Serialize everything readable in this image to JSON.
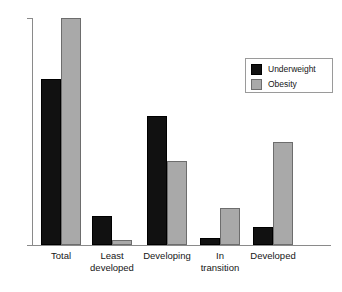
{
  "chart_data": {
    "type": "bar",
    "title": "",
    "subtitle": "",
    "xlabel": "",
    "ylabel": "",
    "categories": [
      "Total",
      "Least\ndeveloped",
      "Developing",
      "In\ntransition",
      "Developed"
    ],
    "series": [
      {
        "name": "Underweight",
        "color": "#111111",
        "values": [
          16.4,
          2.9,
          12.7,
          0.7,
          1.8
        ]
      },
      {
        "name": "Obesity",
        "color": "#a9a9a9",
        "values": [
          22.4,
          0.5,
          8.3,
          3.7,
          10.2
        ]
      }
    ],
    "ylim": [
      0,
      22.4
    ],
    "grid": false,
    "axis_ticks_visible": false,
    "legend_position": "top-right"
  },
  "legend": {
    "items": [
      {
        "label": "Underweight",
        "swatch": "underweight-swatch"
      },
      {
        "label": "Obesity",
        "swatch": "obesity-swatch"
      }
    ]
  },
  "axes": {
    "y_axis_color": "#8a8a8a",
    "x_axis_color": "#8a8a8a"
  }
}
